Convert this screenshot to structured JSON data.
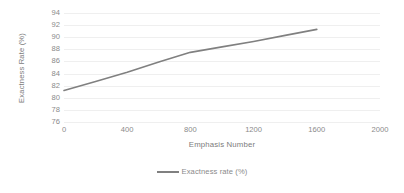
{
  "chart_data": {
    "type": "line",
    "title": "",
    "xlabel": "Emphasis Number",
    "ylabel": "Exactness Rate (%)",
    "xlim": [
      0,
      2000
    ],
    "ylim": [
      76,
      94
    ],
    "xticks": [
      0,
      400,
      800,
      1200,
      1600,
      2000
    ],
    "yticks": [
      76,
      78,
      80,
      82,
      84,
      86,
      88,
      90,
      92,
      94
    ],
    "grid": true,
    "legend_position": "bottom",
    "series": [
      {
        "name": "Exactness rate (%)",
        "color": "#808080",
        "x": [
          0,
          200,
          400,
          600,
          800,
          1000,
          1200,
          1400,
          1600
        ],
        "values": [
          81.2,
          82.7,
          84.2,
          85.9,
          87.5,
          88.4,
          89.3,
          90.3,
          91.3
        ]
      }
    ]
  },
  "legend": {
    "entries": [
      {
        "label": "Exactness rate (%)",
        "color": "#808080"
      }
    ]
  },
  "axes": {
    "y_title": "Exactness Rate (%)",
    "x_title": "Emphasis Number",
    "y_tick_labels": [
      "94",
      "92",
      "90",
      "88",
      "86",
      "84",
      "82",
      "80",
      "78",
      "76"
    ],
    "x_tick_labels": [
      "0",
      "400",
      "800",
      "1200",
      "1600",
      "2000"
    ]
  },
  "colors": {
    "series_line": "#808080",
    "gridline": "#efefef",
    "axis": "#e2e2e2",
    "tick_text": "#8a8a8a",
    "title_text": "#7b7b7b",
    "background": "#ffffff"
  }
}
